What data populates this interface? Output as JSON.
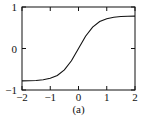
{
  "chart_data": {
    "type": "line",
    "title": "",
    "caption": "(a)",
    "xlabel": "",
    "ylabel": "",
    "xlim": [
      -2,
      2
    ],
    "ylim": [
      -1,
      1
    ],
    "grid": false,
    "legend": null,
    "x_ticks": [
      -2,
      -1,
      0,
      1,
      2
    ],
    "x_tick_labels": [
      "−2",
      "−1",
      "0",
      "1",
      "2"
    ],
    "y_ticks": [
      -1,
      0,
      1
    ],
    "y_tick_labels": [
      "−1",
      "0",
      "1"
    ],
    "series": [
      {
        "name": "sigmoid curve",
        "color": "#111111",
        "x": [
          -2,
          -1.75,
          -1.5,
          -1.25,
          -1,
          -0.75,
          -0.5,
          -0.25,
          0,
          0.25,
          0.5,
          0.75,
          1,
          1.25,
          1.5,
          1.75,
          2
        ],
        "y": [
          -0.78,
          -0.776,
          -0.77,
          -0.755,
          -0.719,
          -0.65,
          -0.516,
          -0.295,
          0,
          0.295,
          0.516,
          0.65,
          0.719,
          0.755,
          0.77,
          0.776,
          0.78
        ]
      }
    ]
  }
}
